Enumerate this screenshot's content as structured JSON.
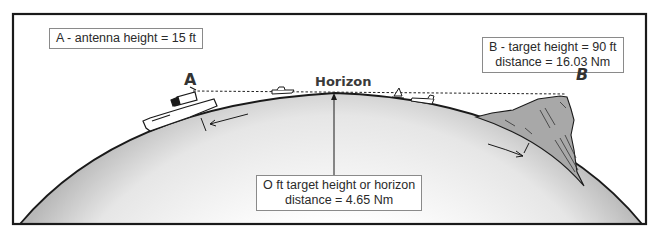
{
  "diagram": {
    "labels": {
      "antenna": "A - antenna height = 15 ft",
      "target_line1": "B - target height = 90 ft",
      "target_line2": "distance = 16.03 Nm",
      "horizon": "Horizon",
      "horizon_note_line1": "O ft target height or horizon",
      "horizon_note_line2": "distance = 4.65 Nm",
      "point_a": "A",
      "point_b": "B"
    },
    "values": {
      "antenna_height_ft": 15,
      "target_height_ft": 90,
      "target_distance_nm": 16.03,
      "horizon_distance_nm": 4.65
    },
    "colors": {
      "frame": "#1a1a1a",
      "globe_shade": "#c8c8c8",
      "mountain": "#a8a8a8",
      "box_border": "#8a8a8a"
    }
  }
}
